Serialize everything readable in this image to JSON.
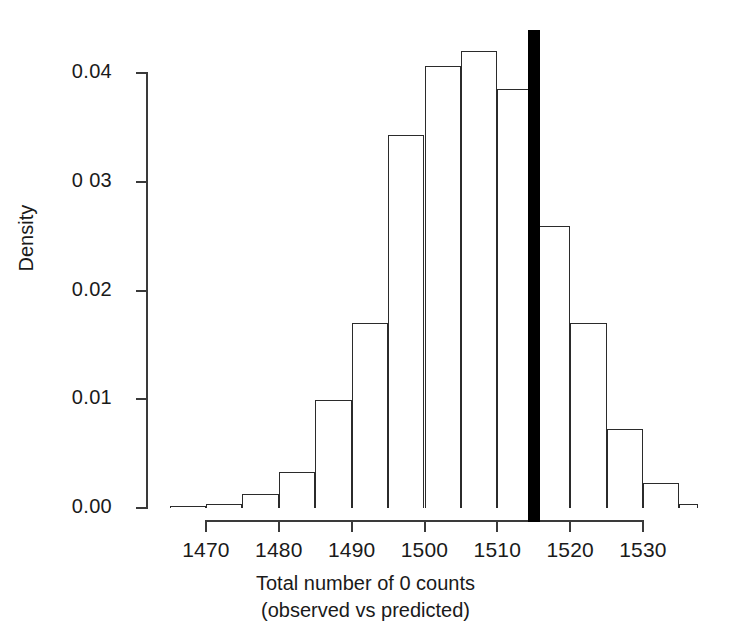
{
  "chart_data": {
    "type": "bar",
    "subtype": "histogram",
    "title": "",
    "xlabel": "Total number of 0 counts\n(observed vs predicted)",
    "xlabel_line1": "Total number of 0 counts",
    "xlabel_line2": "(observed vs predicted)",
    "ylabel": "Density",
    "xlim": [
      1465,
      1535
    ],
    "ylim": [
      0.0,
      0.0425
    ],
    "grid": false,
    "legend": null,
    "bin_width": 5,
    "bin_edges": [
      1465,
      1470,
      1475,
      1480,
      1485,
      1490,
      1495,
      1500,
      1505,
      1510,
      1515,
      1520,
      1525,
      1530,
      1535
    ],
    "categories": [
      "1465-1470",
      "1470-1475",
      "1475-1480",
      "1480-1485",
      "1485-1490",
      "1490-1495",
      "1495-1500",
      "1500-1505",
      "1505-1510",
      "1510-1515",
      "1515-1520",
      "1520-1525",
      "1525-1530",
      "1530-1535"
    ],
    "values": [
      0.0002,
      0.0004,
      0.0013,
      0.0033,
      0.0099,
      0.017,
      0.0343,
      0.0406,
      0.042,
      0.0385,
      0.0259,
      0.017,
      0.0073,
      0.0023
    ],
    "tail_value": 0.0004,
    "xticks": [
      1470,
      1480,
      1490,
      1500,
      1510,
      1520,
      1530
    ],
    "xticklabels": [
      "1470",
      "1480",
      "1490",
      "1500",
      "1510",
      "1520",
      "1530"
    ],
    "yticks": [
      0.0,
      0.01,
      0.02,
      0.03,
      0.04
    ],
    "yticklabels": [
      "0.00",
      "0.01",
      "0.02",
      "0 03",
      "0.04"
    ],
    "annotations": [
      {
        "name": "observed-value-line",
        "type": "vline",
        "x": 1515,
        "color": "#000000",
        "linewidth": 12,
        "description": "observed total number of 0 counts"
      }
    ]
  }
}
